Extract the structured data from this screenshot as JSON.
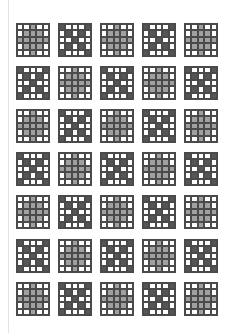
{
  "sheet": {
    "columns": 5,
    "rows": 7,
    "tile_size_px": 34,
    "col_x": [
      16,
      58,
      100,
      142,
      184
    ],
    "row_y": [
      23,
      66,
      109,
      152,
      195,
      239,
      282
    ],
    "layout": [
      [
        "plus",
        "x",
        "plus",
        "x",
        "plus"
      ],
      [
        "x",
        "plus",
        "x",
        "plus",
        "x"
      ],
      [
        "plus",
        "x",
        "plus",
        "x",
        "plus"
      ],
      [
        "x",
        "plus",
        "x",
        "plus",
        "x"
      ],
      [
        "plus",
        "x",
        "plus",
        "x",
        "plus"
      ],
      [
        "x",
        "plus",
        "x",
        "plus",
        "x"
      ],
      [
        "plus",
        "x",
        "plus",
        "x",
        "plus"
      ]
    ]
  },
  "patterns": {
    "plus": [
      [
        "w",
        "w",
        "g",
        "w",
        "w"
      ],
      [
        "w",
        "g",
        "g",
        "g",
        "w"
      ],
      [
        "g",
        "g",
        "g",
        "g",
        "g"
      ],
      [
        "w",
        "g",
        "g",
        "g",
        "w"
      ],
      [
        "w",
        "w",
        "g",
        "w",
        "w"
      ]
    ],
    "x": [
      [
        "d",
        "w",
        "w",
        "w",
        "d"
      ],
      [
        "w",
        "d",
        "w",
        "d",
        "w"
      ],
      [
        "w",
        "w",
        "d",
        "w",
        "w"
      ],
      [
        "w",
        "d",
        "w",
        "d",
        "w"
      ],
      [
        "d",
        "w",
        "w",
        "w",
        "d"
      ]
    ]
  },
  "colors": {
    "background": "#ffffff",
    "grid_line": "#4a4a4a",
    "light_fill": "#a0a0a0",
    "dark_fill": "#555555",
    "page_edge": "#e2e2e2"
  }
}
